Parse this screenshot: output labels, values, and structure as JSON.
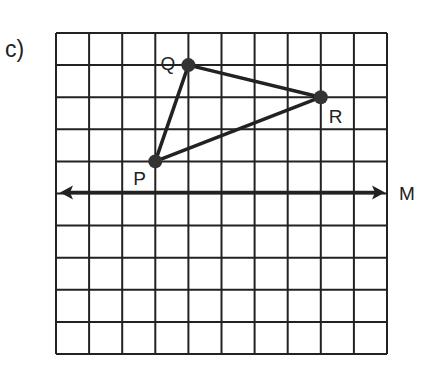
{
  "part_label": "c)",
  "grid": {
    "columns": 10,
    "rows": 10,
    "left": 56,
    "top": 33,
    "cell_w": 33.1,
    "cell_h": 32.1,
    "line_color": "#222222"
  },
  "points": [
    {
      "name": "Q",
      "col": 4,
      "row": 1,
      "label_dx": -28,
      "label_dy": 5
    },
    {
      "name": "R",
      "col": 8,
      "row": 2,
      "label_dx": 8,
      "label_dy": 26
    },
    {
      "name": "P",
      "col": 3,
      "row": 4,
      "label_dx": -22,
      "label_dy": 24
    }
  ],
  "triangle": [
    "P",
    "Q",
    "R"
  ],
  "mirror_line": {
    "label": "M",
    "row": 5
  },
  "colors": {
    "ink": "#222222",
    "background": "#ffffff"
  }
}
